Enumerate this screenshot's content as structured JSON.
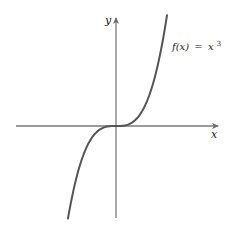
{
  "figure": {
    "type": "function-plot",
    "curve_label": "f(x) = x³",
    "curve_label_parts": {
      "fx": "f(x)",
      "eq": "=",
      "x": "x",
      "exp": "3"
    },
    "x_axis_label": "x",
    "y_axis_label": "y",
    "colors": {
      "axis": "#7a7a7a",
      "curve": "#555555",
      "text": "#222222"
    }
  },
  "chart_data": {
    "type": "line",
    "title": "",
    "function": "f(x) = x^3",
    "xlabel": "x",
    "ylabel": "y",
    "grid": false,
    "ticks": false,
    "x": [
      -1.45,
      -1.2,
      -1.0,
      -0.75,
      -0.5,
      -0.25,
      0,
      0.25,
      0.5,
      0.75,
      1.0,
      1.2,
      1.45
    ],
    "values": [
      -3.05,
      -1.73,
      -1.0,
      -0.42,
      -0.125,
      -0.016,
      0,
      0.016,
      0.125,
      0.42,
      1.0,
      1.73,
      3.05
    ]
  }
}
